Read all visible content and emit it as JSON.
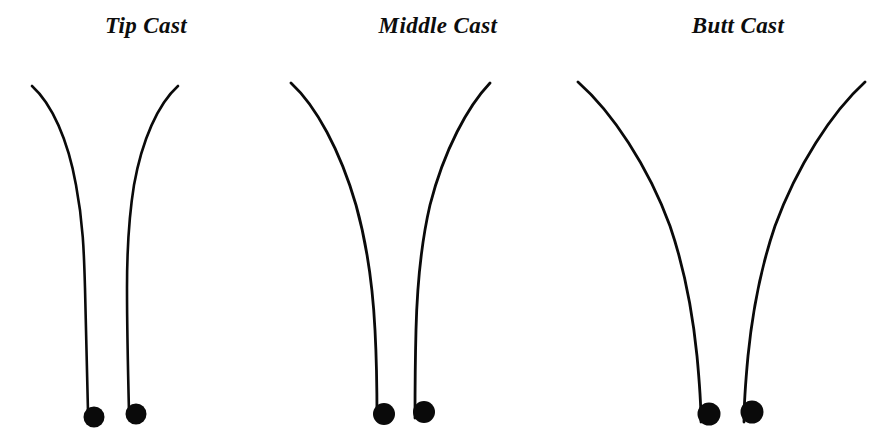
{
  "figure": {
    "title": "",
    "background_color": "#ffffff",
    "stroke_color": "#0a0a0a",
    "width": 892,
    "height": 447
  },
  "panels": [
    {
      "id": "tip-cast",
      "label": "Tip Cast",
      "x": 0,
      "width": 292,
      "description": "Rod bends only near the tip; lower two-thirds stay straight.",
      "rods": [
        {
          "id": "tip-cast-left-rod",
          "side": "left",
          "path": "M 32 86 C 52 104 68 140 76 185 C 83 222 84 252 85 288 C 86 330 87 372 88 412",
          "stroke_width": 2.6,
          "dot": {
            "cx": 94,
            "cy": 417,
            "r": 10.5
          }
        },
        {
          "id": "tip-cast-right-rod",
          "side": "right",
          "path": "M 178 86 C 158 104 142 140 134 185 C 128 222 127 252 127 288 C 127 330 128 372 129 412",
          "stroke_width": 2.6,
          "dot": {
            "cx": 136,
            "cy": 414,
            "r": 10.5
          }
        }
      ]
    },
    {
      "id": "middle-cast",
      "label": "Middle Cast",
      "x": 292,
      "width": 292,
      "description": "Rod bends through the middle section with a longer, deeper arc.",
      "rods": [
        {
          "id": "middle-cast-left-rod",
          "side": "left",
          "path": "M 291 83 C 316 106 340 150 356 205 C 368 248 373 290 375 330 C 377 368 377 398 377 418",
          "stroke_width": 2.8,
          "dot": {
            "cx": 384,
            "cy": 414,
            "r": 11
          }
        },
        {
          "id": "middle-cast-right-rod",
          "side": "right",
          "path": "M 490 83 C 468 106 444 150 430 205 C 420 248 417 290 416 330 C 415 368 415 398 415 418",
          "stroke_width": 2.8,
          "dot": {
            "cx": 424,
            "cy": 412,
            "r": 11
          }
        }
      ]
    },
    {
      "id": "butt-cast",
      "label": "Butt Cast",
      "x": 584,
      "width": 308,
      "description": "Rod bends continuously from the butt all the way to the tip.",
      "rods": [
        {
          "id": "butt-cast-left-rod",
          "side": "left",
          "path": "M 578 82 C 612 112 648 166 670 226 C 685 270 693 316 697 356 C 700 388 701 408 701 422",
          "stroke_width": 2.8,
          "dot": {
            "cx": 709,
            "cy": 414,
            "r": 11.5
          }
        },
        {
          "id": "butt-cast-right-rod",
          "side": "right",
          "path": "M 865 82 C 832 112 797 166 775 226 C 760 270 752 316 748 356 C 745 388 744 408 744 422",
          "stroke_width": 2.8,
          "dot": {
            "cx": 752,
            "cy": 412,
            "r": 11.5
          }
        }
      ]
    }
  ]
}
